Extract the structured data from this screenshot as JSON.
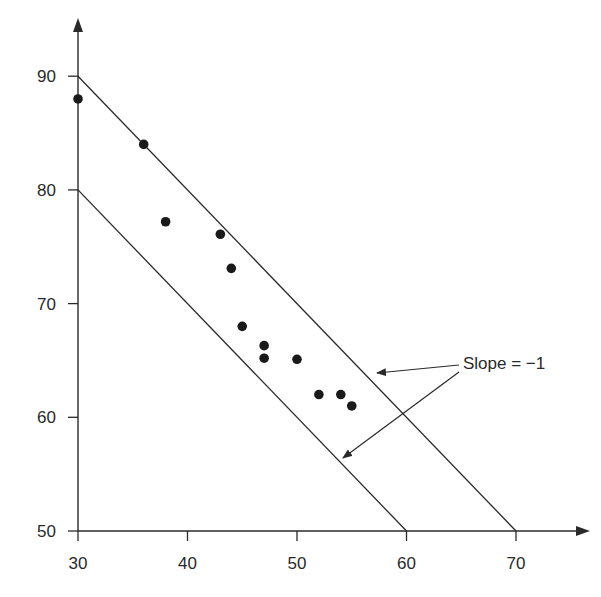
{
  "chart_data": {
    "type": "scatter",
    "title": "",
    "xlabel": "",
    "ylabel": "",
    "xlim": [
      30,
      72
    ],
    "ylim": [
      50,
      93
    ],
    "x_ticks": [
      30,
      40,
      50,
      60,
      70
    ],
    "y_ticks": [
      50,
      60,
      70,
      80,
      90
    ],
    "grid": false,
    "legend": null,
    "series": [
      {
        "name": "points",
        "x": [
          30,
          36,
          38,
          43,
          44,
          45,
          47,
          47,
          50,
          52,
          54,
          55
        ],
        "y": [
          88,
          84,
          77.2,
          76.1,
          73.1,
          68,
          66.3,
          65.2,
          65.1,
          62,
          62,
          61
        ]
      }
    ],
    "lines": [
      {
        "name": "upper-boundary",
        "from": [
          30,
          90
        ],
        "to": [
          70,
          50
        ],
        "slope": -1
      },
      {
        "name": "lower-boundary",
        "from": [
          30,
          80
        ],
        "to": [
          60,
          50
        ],
        "slope": -1
      }
    ],
    "annotations": [
      {
        "text": "Slope = −1",
        "arrows_to": [
          "upper-boundary",
          "lower-boundary"
        ]
      }
    ]
  },
  "labels": {
    "annotation": "Slope = −1",
    "x_ticks": [
      "30",
      "40",
      "50",
      "60",
      "70"
    ],
    "y_ticks": [
      "50",
      "60",
      "70",
      "80",
      "90"
    ]
  },
  "colors": {
    "ink": "#2a2a2a",
    "background": "#ffffff"
  }
}
